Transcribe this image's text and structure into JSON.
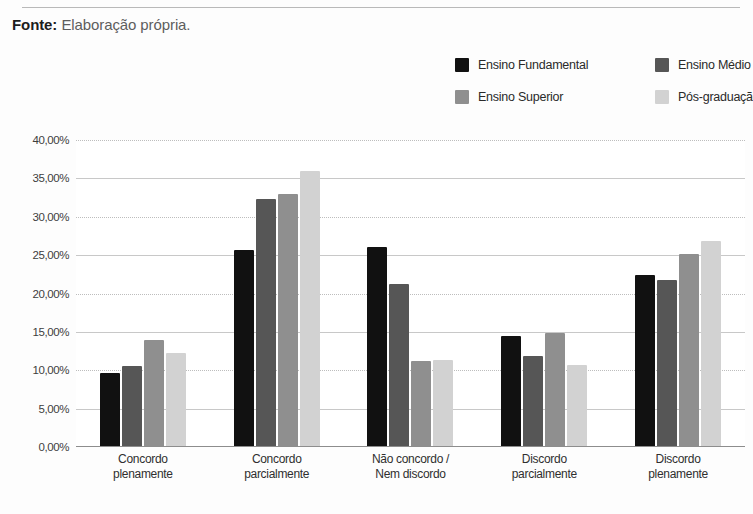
{
  "source": {
    "label": "Fonte:",
    "text": "Elaboração própria."
  },
  "legend": {
    "items": [
      {
        "label": "Ensino Fundamental",
        "color": "#111111"
      },
      {
        "label": "Ensino Médio",
        "color": "#565656"
      },
      {
        "label": "Ensino Superior",
        "color": "#8f8f8f"
      },
      {
        "label": "Pós-graduação",
        "color": "#d2d2d2"
      }
    ]
  },
  "chart_data": {
    "type": "bar",
    "title": "",
    "subtitle": "",
    "xlabel": "",
    "ylabel": "",
    "ylim": [
      0,
      40
    ],
    "ytick_labels": [
      "40,00%",
      "35,00%",
      "30,00%",
      "25,00%",
      "20,00%",
      "15,00%",
      "10,00%",
      "5,00%",
      "0,00%"
    ],
    "ytick_values": [
      40,
      35,
      30,
      25,
      20,
      15,
      10,
      5,
      0
    ],
    "grid": true,
    "legend_position": "top-right",
    "categories": [
      [
        "Concordo",
        "plenamente"
      ],
      [
        "Concordo",
        "parcialmente"
      ],
      [
        "Não concordo /",
        "Nem discordo"
      ],
      [
        "Discordo",
        "parcialmente"
      ],
      [
        "Discordo",
        "plenamente"
      ]
    ],
    "series": [
      {
        "name": "Ensino Fundamental",
        "color": "#111111",
        "values": [
          9.7,
          25.7,
          26.0,
          14.4,
          22.4
        ]
      },
      {
        "name": "Ensino Médio",
        "color": "#565656",
        "values": [
          10.6,
          32.3,
          21.2,
          11.8,
          21.7
        ]
      },
      {
        "name": "Ensino Superior",
        "color": "#8f8f8f",
        "values": [
          13.9,
          33.0,
          11.2,
          14.8,
          25.1
        ]
      },
      {
        "name": "Pós-graduação",
        "color": "#d2d2d2",
        "values": [
          12.2,
          35.9,
          11.4,
          10.7,
          26.9
        ]
      }
    ]
  }
}
